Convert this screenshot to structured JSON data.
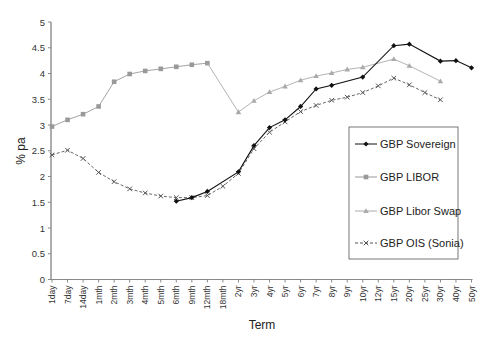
{
  "chart_data": {
    "type": "line",
    "title": "",
    "xlabel": "Term",
    "ylabel": "% pa",
    "ylim": [
      0,
      5
    ],
    "yticks": [
      "0",
      "0.5",
      "1",
      "1.5",
      "2",
      "2.5",
      "3",
      "3.5",
      "4",
      "4.5",
      "5"
    ],
    "grid": false,
    "legend_position": "right-inside",
    "categories": [
      "1day",
      "7day",
      "14day",
      "1mth",
      "2mth",
      "3mth",
      "4mth",
      "5mth",
      "6mth",
      "9mth",
      "12mth",
      "18mth",
      "2yr",
      "3yr",
      "4yr",
      "5yr",
      "6yr",
      "7yr",
      "8yr",
      "9yr",
      "10yr",
      "12yr",
      "15yr",
      "20yr",
      "25yr",
      "30yr",
      "40yr",
      "50yr"
    ],
    "series": [
      {
        "name": "GBP Sovereign",
        "color": "#111111",
        "marker": "diamond",
        "dash": "",
        "values": [
          null,
          null,
          null,
          null,
          null,
          null,
          null,
          null,
          1.52,
          1.59,
          1.71,
          null,
          2.09,
          2.6,
          2.95,
          3.1,
          3.36,
          3.7,
          3.77,
          null,
          3.93,
          null,
          4.54,
          4.57,
          null,
          4.24,
          4.25,
          4.11
        ]
      },
      {
        "name": "GBP LIBOR",
        "color": "#999999",
        "marker": "square",
        "dash": "",
        "values": [
          2.97,
          3.1,
          3.21,
          3.36,
          3.84,
          3.99,
          4.05,
          4.09,
          4.13,
          4.17,
          4.2,
          null,
          null,
          null,
          null,
          null,
          null,
          null,
          null,
          null,
          null,
          null,
          null,
          null,
          null,
          null,
          null,
          null
        ]
      },
      {
        "name": "GBP Libor Swap",
        "color": "#aaaaaa",
        "marker": "triangle",
        "dash": "",
        "values": [
          null,
          null,
          null,
          null,
          null,
          null,
          null,
          null,
          null,
          null,
          4.2,
          null,
          3.25,
          3.47,
          3.64,
          3.75,
          3.87,
          3.95,
          4.01,
          4.08,
          4.12,
          null,
          4.28,
          4.15,
          null,
          3.85,
          null,
          null
        ],
        "markerless_indices": [
          10
        ]
      },
      {
        "name": "GBP OIS (Sonia)",
        "color": "#555555",
        "marker": "x",
        "dash": "3,2",
        "values": [
          2.42,
          2.51,
          2.35,
          2.08,
          1.9,
          1.76,
          1.68,
          1.62,
          1.59,
          1.59,
          1.63,
          1.81,
          2.06,
          2.54,
          2.86,
          3.06,
          3.26,
          3.38,
          3.48,
          3.54,
          3.63,
          3.76,
          3.91,
          3.78,
          3.63,
          3.49,
          null,
          null
        ]
      }
    ]
  }
}
